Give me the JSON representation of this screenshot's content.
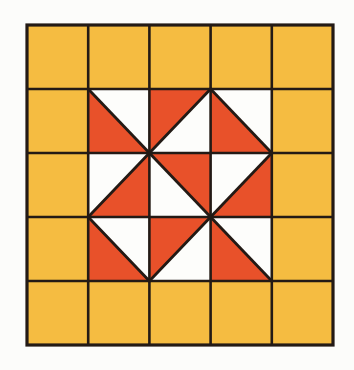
{
  "figure": {
    "canvas": {
      "width": 354,
      "height": 370
    },
    "background_color": "#fcfcfa"
  },
  "palette": {
    "gold": "#f5bc41",
    "red": "#e8512a",
    "white": "#fdfdfb",
    "line": "#231a15",
    "background": "#fcfcfa"
  },
  "grid": {
    "rows": 5,
    "columns": 5,
    "origin_x": 27,
    "origin_y": 25,
    "cell_width": 61.2,
    "cell_height": 64.0,
    "outer_stroke_width": 3.2,
    "inner_stroke_width": 2.6,
    "diagonal_stroke_width": 2.8
  },
  "chart_data": {
    "type": "heatmap",
    "xlabel": "",
    "ylabel": "",
    "categories": [
      "col0",
      "col1",
      "col2",
      "col3",
      "col4"
    ],
    "row_labels": [
      "row0",
      "row1",
      "row2",
      "row3",
      "row4"
    ],
    "legend": [
      {
        "label": "Gold solid square",
        "color": "#f5bc41"
      },
      {
        "label": "Red triangle half",
        "color": "#e8512a"
      },
      {
        "label": "White triangle half",
        "color": "#fdfdfb"
      }
    ],
    "cells": [
      {
        "row": 0,
        "col": 0,
        "kind": "solid",
        "fill": "gold"
      },
      {
        "row": 0,
        "col": 1,
        "kind": "solid",
        "fill": "gold"
      },
      {
        "row": 0,
        "col": 2,
        "kind": "solid",
        "fill": "gold"
      },
      {
        "row": 0,
        "col": 3,
        "kind": "solid",
        "fill": "gold"
      },
      {
        "row": 0,
        "col": 4,
        "kind": "solid",
        "fill": "gold"
      },
      {
        "row": 1,
        "col": 0,
        "kind": "solid",
        "fill": "gold"
      },
      {
        "row": 1,
        "col": 1,
        "kind": "half",
        "diagonal": "tl-br",
        "upper_fill": "white",
        "lower_fill": "red"
      },
      {
        "row": 1,
        "col": 2,
        "kind": "half",
        "diagonal": "tr-bl",
        "upper_fill": "red",
        "lower_fill": "white"
      },
      {
        "row": 1,
        "col": 3,
        "kind": "half",
        "diagonal": "tl-br",
        "upper_fill": "white",
        "lower_fill": "red"
      },
      {
        "row": 1,
        "col": 4,
        "kind": "solid",
        "fill": "gold"
      },
      {
        "row": 2,
        "col": 0,
        "kind": "solid",
        "fill": "gold"
      },
      {
        "row": 2,
        "col": 1,
        "kind": "half",
        "diagonal": "tr-bl",
        "upper_fill": "white",
        "lower_fill": "red"
      },
      {
        "row": 2,
        "col": 2,
        "kind": "half",
        "diagonal": "tl-br",
        "upper_fill": "red",
        "lower_fill": "white"
      },
      {
        "row": 2,
        "col": 3,
        "kind": "half",
        "diagonal": "tr-bl",
        "upper_fill": "white",
        "lower_fill": "red"
      },
      {
        "row": 2,
        "col": 4,
        "kind": "solid",
        "fill": "gold"
      },
      {
        "row": 3,
        "col": 0,
        "kind": "solid",
        "fill": "gold"
      },
      {
        "row": 3,
        "col": 1,
        "kind": "half",
        "diagonal": "tl-br",
        "upper_fill": "white",
        "lower_fill": "red"
      },
      {
        "row": 3,
        "col": 2,
        "kind": "half",
        "diagonal": "tr-bl",
        "upper_fill": "red",
        "lower_fill": "white"
      },
      {
        "row": 3,
        "col": 3,
        "kind": "half",
        "diagonal": "tl-br",
        "upper_fill": "white",
        "lower_fill": "red"
      },
      {
        "row": 3,
        "col": 4,
        "kind": "solid",
        "fill": "gold"
      },
      {
        "row": 4,
        "col": 0,
        "kind": "solid",
        "fill": "gold"
      },
      {
        "row": 4,
        "col": 1,
        "kind": "solid",
        "fill": "gold"
      },
      {
        "row": 4,
        "col": 2,
        "kind": "solid",
        "fill": "gold"
      },
      {
        "row": 4,
        "col": 3,
        "kind": "solid",
        "fill": "gold"
      },
      {
        "row": 4,
        "col": 4,
        "kind": "solid",
        "fill": "gold"
      }
    ]
  }
}
